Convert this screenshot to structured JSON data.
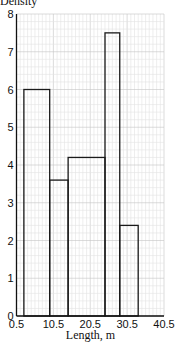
{
  "chart_data": {
    "type": "bar",
    "subtype": "histogram",
    "title": "",
    "xlabel": "Length, m",
    "ylabel": "Density",
    "xlim": [
      0.5,
      40.5
    ],
    "ylim": [
      0,
      8
    ],
    "x_ticks": [
      "0.5",
      "10.5",
      "20.5",
      "30.5",
      "40.5"
    ],
    "y_ticks": [
      "0",
      "1",
      "2",
      "3",
      "4",
      "5",
      "6",
      "7",
      "8"
    ],
    "grid": true,
    "bins": [
      {
        "from": 2.5,
        "to": 9.5,
        "density": 6.0
      },
      {
        "from": 9.5,
        "to": 14.5,
        "density": 3.6
      },
      {
        "from": 14.5,
        "to": 24.5,
        "density": 4.2
      },
      {
        "from": 24.5,
        "to": 28.5,
        "density": 7.5
      },
      {
        "from": 28.5,
        "to": 33.5,
        "density": 2.4
      }
    ],
    "categories": [
      "2.5–9.5",
      "9.5–14.5",
      "14.5–24.5",
      "24.5–28.5",
      "28.5–33.5"
    ],
    "values": [
      6.0,
      3.6,
      4.2,
      7.5,
      2.4
    ]
  },
  "colors": {
    "grid_minor": "#e2e2e2",
    "grid_major": "#c4c4c4",
    "axis": "#111111",
    "bar_edge": "#1a1a1a"
  }
}
